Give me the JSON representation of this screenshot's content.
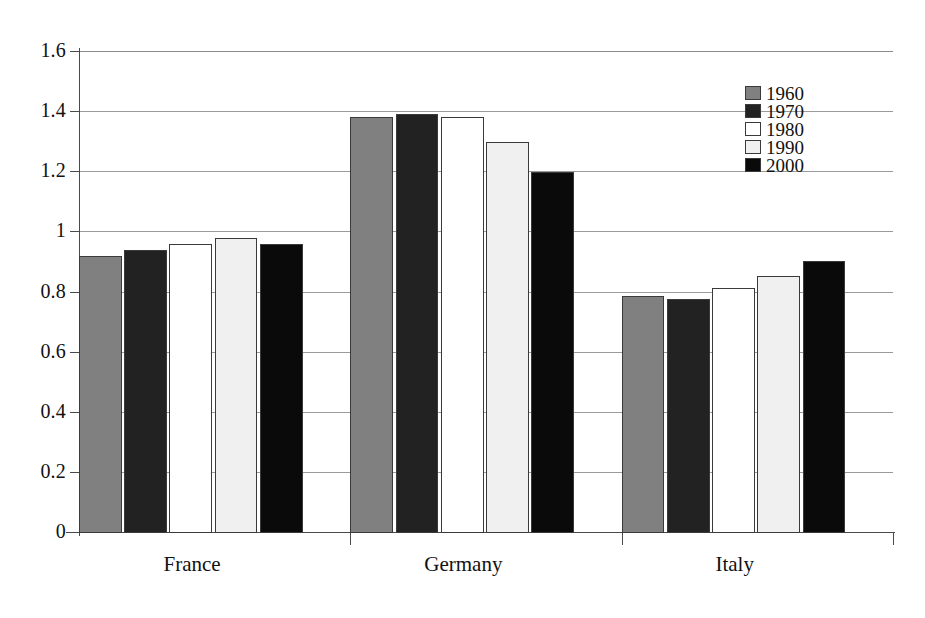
{
  "chart_data": {
    "type": "bar",
    "title": "",
    "subtitle": "",
    "xlabel": "",
    "ylabel": "",
    "categories": [
      "France",
      "Germany",
      "Italy"
    ],
    "series": [
      {
        "name": "1960",
        "color": "#808080",
        "values": [
          0.92,
          1.385,
          0.79
        ]
      },
      {
        "name": "1970",
        "color": "#222222",
        "values": [
          0.94,
          1.395,
          0.78
        ]
      },
      {
        "name": "1980",
        "color": "#ffffff",
        "values": [
          0.96,
          1.385,
          0.815
        ]
      },
      {
        "name": "1990",
        "color": "#f0f0f0",
        "values": [
          0.98,
          1.3,
          0.855
        ]
      },
      {
        "name": "2000",
        "color": "#0a0a0a",
        "values": [
          0.96,
          1.2,
          0.905
        ]
      }
    ],
    "ylim": [
      0,
      1.6
    ],
    "yticks": [
      0,
      0.2,
      0.4,
      0.6,
      0.8,
      1,
      1.2,
      1.4,
      1.6
    ],
    "ytick_labels": [
      "0",
      "0.2",
      "0.4",
      "0.6",
      "0.8",
      "1",
      "1.2",
      "1.4",
      "1.6"
    ],
    "grid": "horizontal",
    "legend_position": "top-right",
    "bar_border_color": "#3a3a3a",
    "axis_color": "#4a4a4a",
    "gridline_color": "#9a9a9a",
    "background": "#ffffff"
  }
}
